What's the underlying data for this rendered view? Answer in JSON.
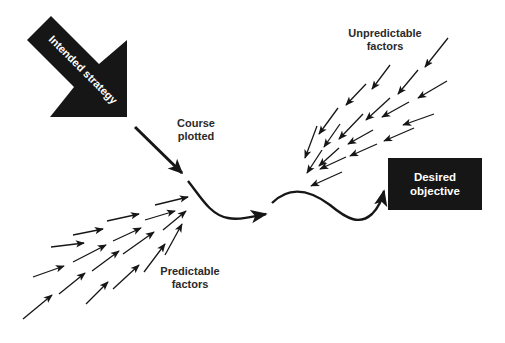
{
  "diagram": {
    "big_arrow_label": "Intended strategy",
    "course_label_line1": "Course",
    "course_label_line2": "plotted",
    "unpredictable_line1": "Unpredictable",
    "unpredictable_line2": "factors",
    "predictable_line1": "Predictable",
    "predictable_line2": "factors",
    "objective_line1": "Desired",
    "objective_line2": "objective",
    "colors": {
      "ink": "#161616",
      "background": "#ffffff"
    }
  }
}
